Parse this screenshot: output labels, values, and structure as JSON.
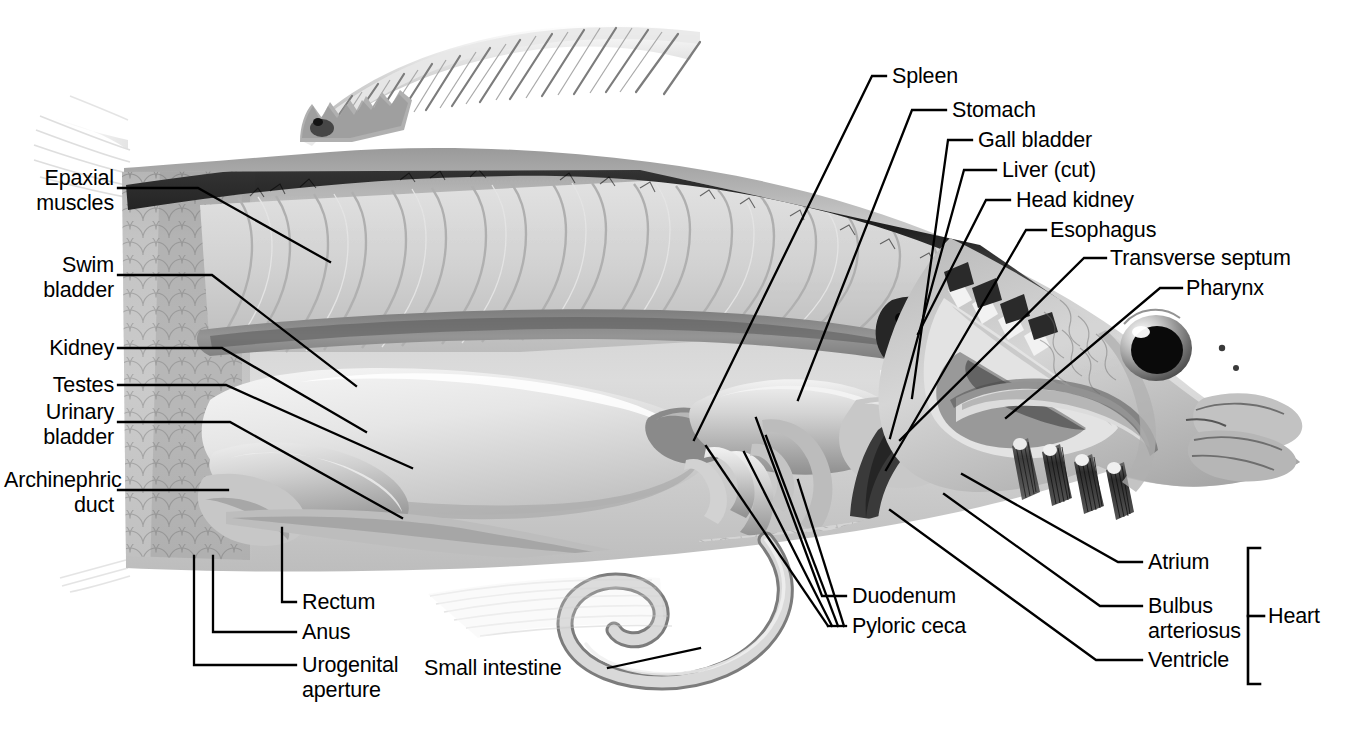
{
  "figure": {
    "view": "left-lateral-cutaway",
    "background_color": "#ffffff",
    "line_color": "#000000",
    "label_color": "#000000"
  },
  "labels": {
    "epaxial_muscles": "Epaxial\nmuscles",
    "swim_bladder": "Swim\nbladder",
    "kidney": "Kidney",
    "testes": "Testes",
    "urinary_bladder": "Urinary\nbladder",
    "archinephric_duct": "Archinephric\nduct",
    "rectum": "Rectum",
    "anus": "Anus",
    "urogenital_aperture": "Urogenital\naperture",
    "small_intestine": "Small intestine",
    "pyloric_ceca": "Pyloric ceca",
    "duodenum": "Duodenum",
    "spleen": "Spleen",
    "stomach": "Stomach",
    "gall_bladder": "Gall bladder",
    "liver_cut": "Liver (cut)",
    "head_kidney": "Head kidney",
    "esophagus": "Esophagus",
    "transverse_septum": "Transverse septum",
    "pharynx": "Pharynx",
    "atrium": "Atrium",
    "bulbus_arteriosus": "Bulbus\narteriosus",
    "ventricle": "Ventricle",
    "heart": "Heart"
  },
  "label_groups": {
    "left_column": [
      "epaxial_muscles",
      "swim_bladder",
      "kidney",
      "testes",
      "urinary_bladder",
      "archinephric_duct"
    ],
    "bottom_left_column": [
      "rectum",
      "anus",
      "urogenital_aperture"
    ],
    "bottom_center": [
      "small_intestine",
      "duodenum",
      "pyloric_ceca"
    ],
    "top_right_column": [
      "spleen",
      "stomach",
      "gall_bladder",
      "liver_cut",
      "head_kidney",
      "esophagus",
      "transverse_septum",
      "pharynx"
    ],
    "bottom_right_column": [
      "atrium",
      "bulbus_arteriosus",
      "ventricle"
    ],
    "bracket_group": {
      "bracket_label": "heart",
      "members": [
        "atrium",
        "bulbus_arteriosus",
        "ventricle"
      ]
    }
  },
  "anatomy_parts": [
    "dorsal-fin",
    "caudal-peduncle",
    "epaxial-musculature",
    "myomeres",
    "scales",
    "swim-bladder",
    "kidney",
    "testes",
    "urinary-bladder",
    "archinephric-duct",
    "rectum",
    "anus",
    "urogenital-aperture",
    "small-intestine",
    "pyloric-ceca",
    "duodenum",
    "spleen",
    "stomach",
    "gall-bladder",
    "liver",
    "head-kidney",
    "esophagus",
    "transverse-septum",
    "pharynx",
    "gill-arches",
    "gill-filaments",
    "operculum",
    "eye",
    "jaw",
    "heart-atrium",
    "heart-bulbus-arteriosus",
    "heart-ventricle",
    "pelvic-fin",
    "anal-fin"
  ]
}
